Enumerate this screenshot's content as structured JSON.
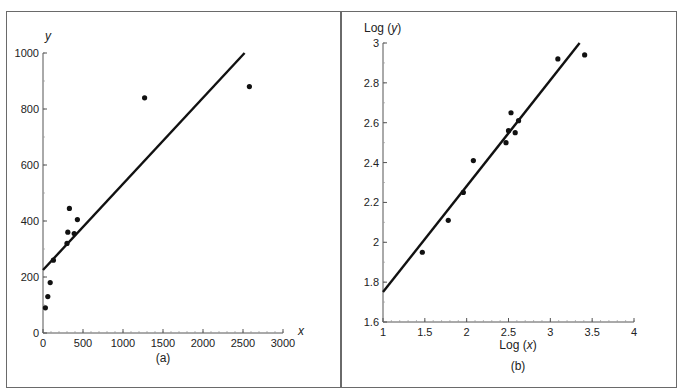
{
  "chart_data": [
    {
      "id": "a",
      "type": "scatter",
      "title": "",
      "caption": "(a)",
      "xlabel": "x",
      "ylabel": "y",
      "xlim": [
        0,
        3000
      ],
      "ylim": [
        0,
        1000
      ],
      "x_ticks": [
        0,
        500,
        1000,
        1500,
        2000,
        2500,
        3000
      ],
      "y_ticks": [
        0,
        200,
        400,
        600,
        800,
        1000
      ],
      "grid": false,
      "series": [
        {
          "name": "data",
          "kind": "scatter",
          "points": [
            [
              30,
              90
            ],
            [
              60,
              130
            ],
            [
              90,
              180
            ],
            [
              130,
              260
            ],
            [
              300,
              320
            ],
            [
              310,
              360
            ],
            [
              330,
              445
            ],
            [
              390,
              355
            ],
            [
              430,
              405
            ],
            [
              1270,
              840
            ],
            [
              2580,
              880
            ]
          ]
        },
        {
          "name": "fit",
          "kind": "line",
          "points": [
            [
              0,
              225
            ],
            [
              2520,
              1000
            ]
          ]
        }
      ]
    },
    {
      "id": "b",
      "type": "scatter",
      "title": "",
      "caption": "(b)",
      "xlabel": "Log (x)",
      "ylabel": "Log (y)",
      "xlim": [
        1,
        4
      ],
      "ylim": [
        1.6,
        3
      ],
      "x_ticks": [
        1,
        1.5,
        2,
        2.5,
        3,
        3.5,
        4
      ],
      "y_ticks": [
        1.6,
        1.8,
        2,
        2.2,
        2.4,
        2.6,
        2.8,
        3
      ],
      "grid": false,
      "series": [
        {
          "name": "data",
          "kind": "scatter",
          "points": [
            [
              1.47,
              1.95
            ],
            [
              1.78,
              2.11
            ],
            [
              1.96,
              2.25
            ],
            [
              2.08,
              2.41
            ],
            [
              2.47,
              2.5
            ],
            [
              2.5,
              2.56
            ],
            [
              2.53,
              2.65
            ],
            [
              2.58,
              2.55
            ],
            [
              2.62,
              2.61
            ],
            [
              3.09,
              2.92
            ],
            [
              3.41,
              2.94
            ]
          ]
        },
        {
          "name": "fit",
          "kind": "line",
          "points": [
            [
              1,
              1.75
            ],
            [
              3.35,
              3.0
            ]
          ]
        }
      ]
    }
  ],
  "labels": {
    "a": {
      "caption": "(a)",
      "xlabel": "x",
      "ylabel": "y"
    },
    "b": {
      "caption": "(b)",
      "xlabel_prefix": "Log (",
      "xlabel_var": "x",
      "xlabel_suffix": ")",
      "ylabel_prefix": "Log (",
      "ylabel_var": "y",
      "ylabel_suffix": ")"
    }
  },
  "colors": {
    "ink": "#111111",
    "axis": "#555555",
    "border": "#6a6a6a",
    "background": "#ffffff"
  }
}
